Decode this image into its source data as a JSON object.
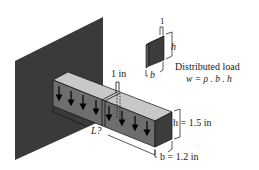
{
  "diagram": {
    "type": "cantilever-beam-isometric",
    "colors": {
      "wall": "#3a3a3a",
      "beam_top": "#c8c8c8",
      "beam_front": "#6e6e6e",
      "beam_end": "#3c3c3c",
      "slice": "#3c3c3c",
      "line": "#111111"
    },
    "labels": {
      "slice_width": "1 in",
      "length": "L?",
      "height": "h = 1.5 in",
      "width": "b = 1.2 in",
      "inset_unit": "1",
      "inset_h": "h",
      "inset_b": "b",
      "load_title": "Distributed load",
      "load_formula": "w = ρ . b . h"
    },
    "arrows_count": 8
  }
}
